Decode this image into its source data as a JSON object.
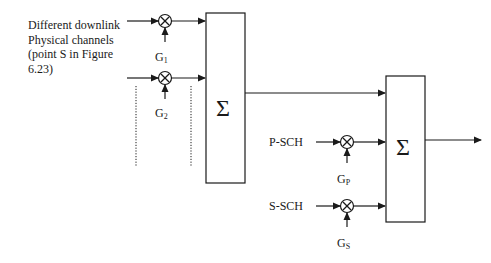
{
  "diagram": {
    "caption_lines": [
      "Different downlink",
      "Physical channels",
      "(point S in Figure",
      "6.23)"
    ],
    "gains": {
      "g1": {
        "base": "G",
        "sub": "1"
      },
      "g2": {
        "base": "G",
        "sub": "2"
      },
      "gp": {
        "base": "G",
        "sub": "P"
      },
      "gs": {
        "base": "G",
        "sub": "S"
      }
    },
    "inputs": {
      "psch": "P-SCH",
      "ssch": "S-SCH"
    },
    "summers": {
      "first": "Σ",
      "second": "Σ"
    },
    "multiplier_symbol": "⊗",
    "line_color": "#1a1a1a"
  }
}
